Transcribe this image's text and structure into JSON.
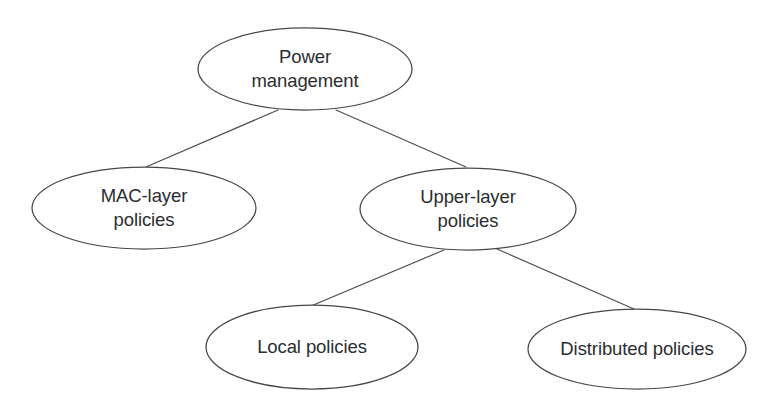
{
  "figure": {
    "title": "Power management",
    "type": "tree-diagram",
    "background_color": "#ffffff",
    "stroke_color": "#45484b",
    "text_color": "#2b2d2f",
    "nodes": [
      {
        "id": "power-management",
        "label_line1": "Power",
        "label_line2": "management",
        "cx": 305,
        "cy": 69,
        "rx": 107,
        "ry": 41,
        "level": 1
      },
      {
        "id": "mac-layer-policies",
        "label_line1": "MAC-layer",
        "label_line2": "policies",
        "cx": 144,
        "cy": 208,
        "rx": 112,
        "ry": 41,
        "level": 2
      },
      {
        "id": "upper-layer-policies",
        "label_line1": "Upper-layer",
        "label_line2": "policies",
        "cx": 468,
        "cy": 209,
        "rx": 108,
        "ry": 41,
        "level": 2
      },
      {
        "id": "local-policies",
        "label_line1": "Local policies",
        "label_line2": "",
        "cx": 312,
        "cy": 347,
        "rx": 106,
        "ry": 42,
        "level": 3
      },
      {
        "id": "distributed-policies",
        "label_line1": "Distributed policies",
        "label_line2": "",
        "cx": 637,
        "cy": 349,
        "rx": 109,
        "ry": 40,
        "level": 3
      }
    ],
    "edges": [
      {
        "id": "edge-power-to-mac",
        "from": "power-management",
        "to": "mac-layer-policies",
        "x1": 278,
        "y1": 110,
        "x2": 146,
        "y2": 167
      },
      {
        "id": "edge-power-to-upper",
        "from": "power-management",
        "to": "upper-layer-policies",
        "x1": 336,
        "y1": 110,
        "x2": 466,
        "y2": 167
      },
      {
        "id": "edge-upper-to-local",
        "from": "upper-layer-policies",
        "to": "local-policies",
        "x1": 444,
        "y1": 250,
        "x2": 311,
        "y2": 306
      },
      {
        "id": "edge-upper-to-distributed",
        "from": "upper-layer-policies",
        "to": "distributed-policies",
        "x1": 497,
        "y1": 249,
        "x2": 634,
        "y2": 309
      }
    ]
  }
}
